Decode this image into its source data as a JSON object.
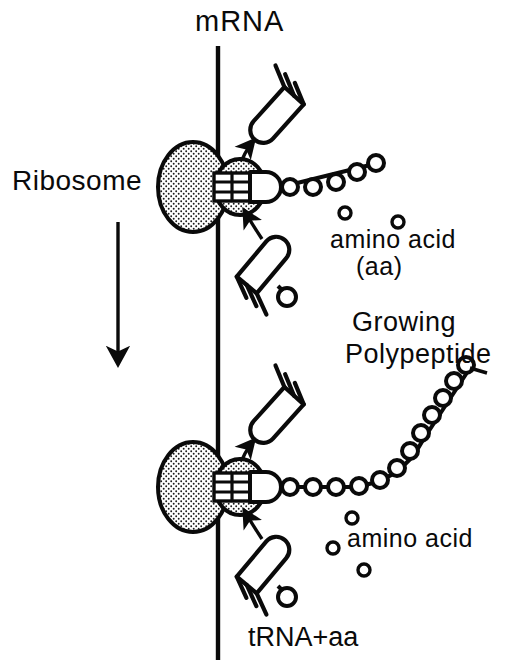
{
  "figure": {
    "background_color": "#ffffff",
    "ink_color": "#0a0a0a",
    "width": 528,
    "height": 670
  },
  "labels": {
    "mrna": "mRNA",
    "ribosome": "Ribosome",
    "amino_acid_top_line1": "amino acid",
    "amino_acid_top_line2": "(aa)",
    "growing": "Growing",
    "polypeptide": "Polypeptide",
    "amino_acid_bottom": "amino acid",
    "trna_plus_aa": "tRNA+aa"
  },
  "elements": {
    "mrna_strand": {
      "name": "mRNA vertical strand",
      "x": 218,
      "y_top": 46,
      "y_bottom": 660,
      "stroke_width": 4
    },
    "direction_arrow": {
      "name": "ribosome movement direction arrow",
      "x": 118,
      "y_top": 222,
      "y_bottom": 368,
      "points": "down"
    },
    "ribosomes": [
      {
        "stage": "upper",
        "large_subunit": {
          "cx": 193,
          "cy": 187,
          "rx": 35,
          "ry": 45,
          "fill": "stipple"
        },
        "small_subunit": {
          "cx": 240,
          "cy": 187,
          "rx": 25,
          "ry": 28,
          "fill": "stipple"
        },
        "peptide_chain_beads": 6,
        "peptide_chain_shape": "short straight rise to upper right"
      },
      {
        "stage": "lower",
        "large_subunit": {
          "cx": 193,
          "cy": 487,
          "rx": 35,
          "ry": 45,
          "fill": "stipple"
        },
        "small_subunit": {
          "cx": 240,
          "cy": 487,
          "rx": 25,
          "ry": 28,
          "fill": "stipple"
        },
        "peptide_chain_beads": 14,
        "peptide_chain_shape": "long curved chain sweeping up to the right"
      }
    ],
    "trna_departing_upper": {
      "name": "tRNA leaving ribosome (upper)",
      "tip_x": 255,
      "tip_y": 155,
      "angle_deg": -48,
      "prongs": 3,
      "carries_amino_acid": false
    },
    "trna_arriving_upper": {
      "name": "tRNA with amino acid arriving (upper)",
      "tip_x": 252,
      "tip_y": 222,
      "angle_deg": 48,
      "prongs": 3,
      "carries_amino_acid": true
    },
    "trna_departing_lower": {
      "name": "tRNA leaving ribosome (lower)",
      "tip_x": 255,
      "tip_y": 455,
      "angle_deg": -48,
      "prongs": 3,
      "carries_amino_acid": false
    },
    "trna_arriving_lower": {
      "name": "tRNA with amino acid arriving (lower)",
      "tip_x": 252,
      "tip_y": 522,
      "angle_deg": 48,
      "prongs": 3,
      "carries_amino_acid": true
    },
    "free_amino_acids_top": [
      {
        "cx": 345,
        "cy": 213,
        "r": 6
      },
      {
        "cx": 398,
        "cy": 222,
        "r": 6
      }
    ],
    "free_amino_acids_bottom": [
      {
        "cx": 352,
        "cy": 518,
        "r": 6
      },
      {
        "cx": 333,
        "cy": 548,
        "r": 6
      },
      {
        "cx": 364,
        "cy": 570,
        "r": 6
      }
    ]
  }
}
